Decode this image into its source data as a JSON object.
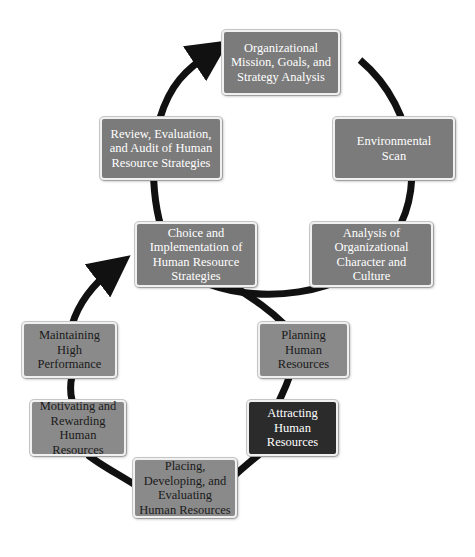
{
  "diagram": {
    "type": "figure-eight cycle",
    "colors": {
      "upper_box": "#7b7b7b",
      "lower_box": "#8a8a8a",
      "highlight_box": "#2b2b2b",
      "arrow": "#111111"
    },
    "upper_cycle": [
      {
        "id": "mission",
        "label": "Organizational Mission, Goals, and Strategy Analysis"
      },
      {
        "id": "env",
        "label": "Environmental Scan"
      },
      {
        "id": "analysis",
        "label": "Analysis of Organizational Character and Culture"
      },
      {
        "id": "choice",
        "label": "Choice and Implementation of Human Resource Strategies"
      },
      {
        "id": "review",
        "label": "Review, Evaluation, and Audit of Human Resource Strategies"
      }
    ],
    "lower_cycle": [
      {
        "id": "planning",
        "label": "Planning Human Resources"
      },
      {
        "id": "attracting",
        "label": "Attracting Human Resources",
        "highlighted": true
      },
      {
        "id": "placing",
        "label": "Placing, Developing, and Evaluating Human Resources"
      },
      {
        "id": "motivating",
        "label": "Motivating and Rewarding Human Resources"
      },
      {
        "id": "maintaining",
        "label": "Maintaining High Performance"
      }
    ]
  }
}
